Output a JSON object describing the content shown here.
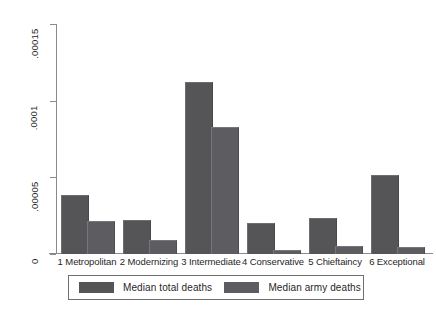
{
  "chart_data": {
    "type": "bar",
    "title": "",
    "subtitle": "",
    "xlabel": "",
    "ylabel": "",
    "categories": [
      "1 Metropolitan",
      "2 Modernizing",
      "3 Intermediate",
      "4 Conservative",
      "5 Chieftaincy",
      "6 Exceptional"
    ],
    "series": [
      {
        "name": "Median total deaths",
        "color": "#555558",
        "values": [
          3.8e-05,
          2.13e-05,
          0.0001113,
          1.93e-05,
          2.27e-05,
          5.07e-05
        ]
      },
      {
        "name": "Median army deaths",
        "color": "#5d5d61",
        "values": [
          2.07e-05,
          8.7e-06,
          8.2e-05,
          2e-06,
          4.7e-06,
          4e-06
        ]
      }
    ],
    "ylim": [
      0,
      0.00015
    ],
    "yticks": [
      0,
      5e-05,
      0.0001,
      0.00015
    ],
    "ytick_labels": [
      "0",
      ".00005",
      ".0001",
      ".00015"
    ],
    "grid": false,
    "legend_position": "bottom",
    "axis_color": "#8a8a8a",
    "background": "#ffffff"
  },
  "legend": {
    "entries": [
      {
        "label": "Median total deaths"
      },
      {
        "label": "Median army deaths"
      }
    ]
  }
}
